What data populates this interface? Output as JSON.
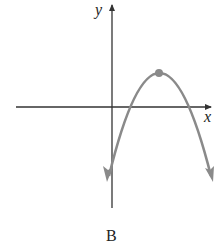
{
  "figure": {
    "label": "B",
    "axes": {
      "x_label": "x",
      "y_label": "y"
    },
    "curve": {
      "type": "downward-opening parabola",
      "vertex_marked": true,
      "description": "Vertex in first quadrant; two positive x-intercepts; negative y-intercept; arrows at both ends pointing down"
    },
    "colors": {
      "axis": "#333333",
      "curve": "#8a8a8a",
      "vertex": "#8a8a8a",
      "text": "#222222"
    }
  }
}
